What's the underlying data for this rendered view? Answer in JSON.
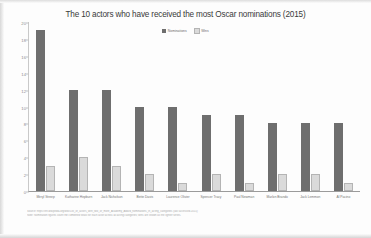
{
  "chart_data": {
    "type": "bar",
    "title": "The 10 actors who have received the most Oscar nominations (2015)",
    "xlabel": "",
    "ylabel": "",
    "ylim": [
      0,
      20
    ],
    "yticks": [
      20,
      18,
      16,
      14,
      12,
      10,
      8,
      6,
      4,
      2,
      0
    ],
    "grid": false,
    "legend_position": "top-center",
    "categories": [
      "Meryl Streep",
      "Katharine Hepburn",
      "Jack Nicholson",
      "Bette Davis",
      "Laurence Olivier",
      "Spencer Tracy",
      "Paul Newman",
      "Marlon Brando",
      "Jack Lemmon",
      "Al Pacino"
    ],
    "series": [
      {
        "name": "Nominations",
        "color": "#6e6e6e",
        "values": [
          19,
          12,
          12,
          10,
          10,
          9,
          9,
          8,
          8,
          8
        ]
      },
      {
        "name": "Wins",
        "color": "#dadada",
        "values": [
          3,
          4,
          3,
          2,
          1,
          2,
          1,
          2,
          2,
          1
        ]
      }
    ]
  },
  "legend": {
    "items": [
      {
        "label": "Nominations",
        "color": "#6e6e6e"
      },
      {
        "label": "Wins",
        "color": "#dadada"
      }
    ]
  },
  "footnote": {
    "lines": [
      "Source: https://en.wikipedia.org/wiki/List_of_actors_with_two_or_more_Academy_Award_nominations_in_acting_categories (last accessed 2015)",
      "Note: Nomination figures count the  combined  totals  for  each  actor  across  all  acting  categories;  wins  are  shown  as  the  lighter  series."
    ]
  }
}
